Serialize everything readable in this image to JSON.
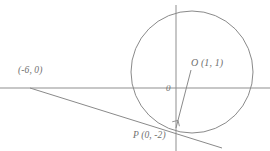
{
  "figure": {
    "background_color": "#ffffff",
    "stroke_color": "#8a8a8a",
    "label_color": "#6f6f6f"
  },
  "axes": {
    "origin_label": "0",
    "x_axis_name": "x-axis",
    "y_axis_name": "y-axis",
    "x_axis_pixel_y": 88,
    "y_axis_pixel_x": 176
  },
  "labels": {
    "point_a": "(-6, 0)",
    "center_o": "O (1, 1)",
    "point_p": "P (0, -2)"
  },
  "points": [
    {
      "name": "A",
      "label": "(-6, 0)",
      "x": -6,
      "y": 0,
      "px": 31,
      "py": 88
    },
    {
      "name": "O",
      "label": "O (1, 1)",
      "x": 1,
      "y": 1,
      "px": 192,
      "py": 72
    },
    {
      "name": "P",
      "label": "P (0, -2)",
      "x": 0,
      "y": -2,
      "px": 176,
      "py": 128
    }
  ],
  "circle": {
    "center_x": 1,
    "center_y": 1,
    "center_px": 192,
    "center_py": 72,
    "radius_px": 61
  },
  "segments": [
    {
      "name": "radius-op",
      "from": "P",
      "to": "O"
    },
    {
      "name": "tangent-line",
      "through": "P",
      "from_px": [
        30,
        88
      ],
      "to_px": [
        222,
        148
      ]
    }
  ],
  "markers": {
    "right_angle_at_p": true
  }
}
